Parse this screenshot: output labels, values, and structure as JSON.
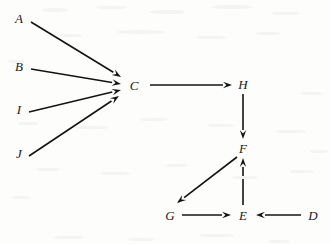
{
  "figure": {
    "type": "directed-graph",
    "background_color": "#fdfdfc",
    "ink_color": "#141414",
    "width": 331,
    "height": 244
  },
  "nodes": [
    {
      "id": "A",
      "label": "A",
      "x": 19,
      "y": 18
    },
    {
      "id": "B",
      "label": "B",
      "x": 19,
      "y": 66
    },
    {
      "id": "I",
      "label": "I",
      "x": 19,
      "y": 109
    },
    {
      "id": "J",
      "label": "J",
      "x": 19,
      "y": 153
    },
    {
      "id": "C",
      "label": "C",
      "x": 134,
      "y": 85
    },
    {
      "id": "H",
      "label": "H",
      "x": 243,
      "y": 84
    },
    {
      "id": "F",
      "label": "F",
      "x": 243,
      "y": 148
    },
    {
      "id": "G",
      "label": "G",
      "x": 170,
      "y": 215
    },
    {
      "id": "E",
      "label": "E",
      "x": 243,
      "y": 215
    },
    {
      "id": "D",
      "label": "D",
      "x": 313,
      "y": 215
    }
  ],
  "edges": [
    {
      "id": "A-C",
      "from": "A",
      "to": "C",
      "x1": 31,
      "y1": 22,
      "x2": 121,
      "y2": 77
    },
    {
      "id": "B-C",
      "from": "B",
      "to": "C",
      "x1": 31,
      "y1": 69,
      "x2": 121,
      "y2": 84
    },
    {
      "id": "I-C",
      "from": "I",
      "to": "C",
      "x1": 29,
      "y1": 112,
      "x2": 121,
      "y2": 90
    },
    {
      "id": "J-C",
      "from": "J",
      "to": "C",
      "x1": 29,
      "y1": 156,
      "x2": 119,
      "y2": 96
    },
    {
      "id": "C-H",
      "from": "C",
      "to": "H",
      "x1": 150,
      "y1": 85,
      "x2": 232,
      "y2": 85
    },
    {
      "id": "H-F",
      "from": "H",
      "to": "F",
      "x1": 243,
      "y1": 94,
      "x2": 243,
      "y2": 139
    },
    {
      "id": "F-G",
      "from": "F",
      "to": "G",
      "x1": 237,
      "y1": 157,
      "x2": 177,
      "y2": 203
    },
    {
      "id": "G-E",
      "from": "G",
      "to": "E",
      "x1": 182,
      "y1": 215,
      "x2": 231,
      "y2": 215
    },
    {
      "id": "E-F",
      "from": "E",
      "to": "F",
      "x1": 243,
      "y1": 205,
      "x2": 243,
      "y2": 158
    },
    {
      "id": "D-E",
      "from": "D",
      "to": "E",
      "x1": 301,
      "y1": 215,
      "x2": 256,
      "y2": 215
    }
  ],
  "style": {
    "stroke_width": 1.6,
    "arrow_length": 9,
    "arrow_halfwidth": 3.2
  }
}
